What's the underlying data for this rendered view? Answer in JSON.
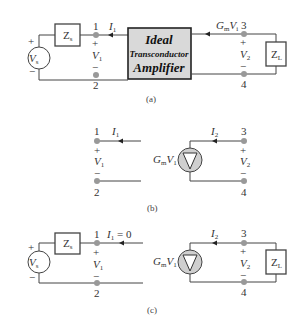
{
  "figure": {
    "panels": [
      {
        "caption": "(a)",
        "source": {
          "label": "V",
          "sub": "s",
          "plus": "+",
          "minus": "−"
        },
        "source_impedance": {
          "label": "Z",
          "sub": "s"
        },
        "amplifier": {
          "line1": "Ideal",
          "line2": "Transconductor",
          "line3": "Amplifier"
        },
        "input_port": {
          "top_node": "1",
          "bottom_node": "2",
          "current": {
            "label": "I",
            "sub": "1"
          },
          "voltage": {
            "label": "V",
            "sub": "1"
          },
          "plus": "+",
          "minus": "−"
        },
        "output_port": {
          "top_node": "3",
          "bottom_node": "4",
          "current": {
            "label": "G",
            "sub": "m",
            "label2": "V",
            "sub2": "i"
          },
          "voltage": {
            "label": "V",
            "sub": "2"
          },
          "plus": "+",
          "minus": "−"
        },
        "load": {
          "label": "Z",
          "sub": "L"
        }
      },
      {
        "caption": "(b)",
        "input_port": {
          "top_node": "1",
          "bottom_node": "2",
          "current": {
            "label": "I",
            "sub": "1"
          },
          "voltage": {
            "label": "V",
            "sub": "1"
          },
          "plus": "+",
          "minus": "−"
        },
        "dependent_source": {
          "label": "G",
          "sub": "m",
          "label2": "V",
          "sub2": "1"
        },
        "output_port": {
          "top_node": "3",
          "bottom_node": "4",
          "current": {
            "label": "I",
            "sub": "2"
          },
          "voltage": {
            "label": "V",
            "sub": "2"
          },
          "plus": "+",
          "minus": "−"
        }
      },
      {
        "caption": "(c)",
        "source": {
          "label": "V",
          "sub": "s",
          "plus": "+",
          "minus": "−"
        },
        "source_impedance": {
          "label": "Z",
          "sub": "s"
        },
        "input_port": {
          "top_node": "1",
          "bottom_node": "2",
          "current": {
            "label": "I",
            "sub": "1",
            "suffix": " = 0"
          },
          "voltage": {
            "label": "V",
            "sub": "1"
          },
          "plus": "+",
          "minus": "−"
        },
        "dependent_source": {
          "label": "G",
          "sub": "m",
          "label2": "V",
          "sub2": "1"
        },
        "output_port": {
          "top_node": "3",
          "bottom_node": "4",
          "current": {
            "label": "I",
            "sub": "2"
          },
          "voltage": {
            "label": "V",
            "sub": "2"
          },
          "plus": "+",
          "minus": "−"
        },
        "load": {
          "label": "Z",
          "sub": "L"
        }
      }
    ],
    "colors": {
      "wire": "#444444",
      "node": "#9a9a9a",
      "amp_fill": "#d9d9d9",
      "source_fill": "#cfcfcf"
    }
  }
}
